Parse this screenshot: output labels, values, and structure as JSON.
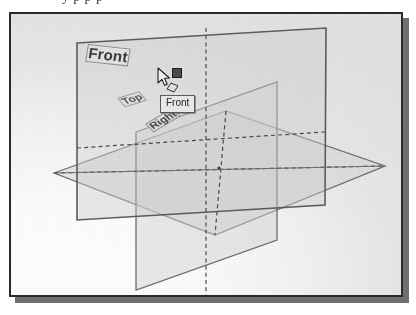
{
  "page": {
    "top_text_sliver": "y p p p"
  },
  "figure": {
    "name": "reference-planes-isometric-view",
    "background_color": "#eeeeee",
    "border_color": "#2b2b2b",
    "shadow_color": "#6f6f6f"
  },
  "viewport": {
    "plane_edge_color": "#6e6e6e",
    "plane_fill_color": "#d7d7d7",
    "dashed_line_color": "#4a4a4a",
    "planes": [
      {
        "id": "front",
        "label": "Front",
        "orientation": "vertical-front",
        "selected": true,
        "points": "66,29 315,14 314,191 66,206"
      },
      {
        "id": "top",
        "label": "Top",
        "orientation": "horizontal",
        "selected": false,
        "points": "43,159 215,97 374,152 204,221"
      },
      {
        "id": "right",
        "label": "Right",
        "orientation": "vertical-side",
        "selected": false,
        "points": "125,118 125,276 266,226 266,68"
      }
    ],
    "center_point": {
      "label": "origin",
      "x": 208,
      "y": 154
    }
  },
  "cursor": {
    "icon": "arrow-pointer-icon",
    "badge_icon": "plane-face-icon",
    "x": 146,
    "y": 53
  },
  "grip": {
    "icon": "selection-grip-square",
    "color": "#4c4c4c",
    "x": 161,
    "y": 54
  },
  "tooltip": {
    "text": "Front",
    "background_color": "#ebebeb",
    "border_color": "#5b5b5b"
  }
}
